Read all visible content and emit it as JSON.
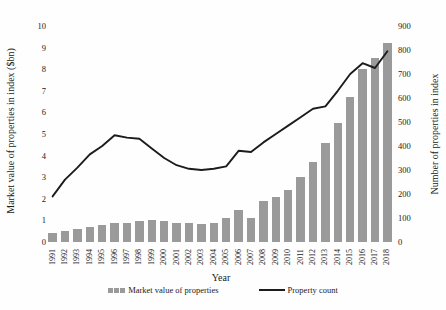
{
  "chart_data": {
    "type": "bar",
    "subtype": "combo-bar-line-dual-axis",
    "title": "",
    "xlabel": "Year",
    "categories": [
      "1991",
      "1992",
      "1993",
      "1994",
      "1995",
      "1996",
      "1997",
      "1998",
      "1999",
      "2000",
      "2001",
      "2002",
      "2003",
      "2004",
      "2005",
      "2006",
      "2007",
      "2008",
      "2009",
      "2010",
      "2011",
      "2012",
      "2013",
      "2014",
      "2015",
      "2016",
      "2017",
      "2018"
    ],
    "series": [
      {
        "name": "Market value of properties",
        "type": "bar",
        "axis": "left",
        "color": "#9a9a9a",
        "values": [
          0.4,
          0.5,
          0.6,
          0.7,
          0.8,
          0.9,
          0.9,
          0.95,
          1.0,
          0.95,
          0.9,
          0.9,
          0.85,
          0.9,
          1.1,
          1.5,
          1.1,
          1.9,
          2.1,
          2.4,
          3.0,
          3.7,
          4.6,
          5.5,
          6.7,
          8.0,
          8.5,
          9.2
        ]
      },
      {
        "name": "Property count",
        "type": "line",
        "axis": "right",
        "color": "#1c1c1c",
        "values": [
          190,
          260,
          310,
          365,
          400,
          445,
          435,
          430,
          390,
          350,
          320,
          305,
          300,
          305,
          315,
          380,
          375,
          415,
          450,
          485,
          520,
          555,
          565,
          630,
          700,
          745,
          725,
          795
        ]
      }
    ],
    "left_axis": {
      "label": "Market value of properties in index ($bn)",
      "min": 0,
      "max": 10,
      "step": 1,
      "ticks": [
        "0",
        "1",
        "2",
        "3",
        "4",
        "5",
        "6",
        "7",
        "8",
        "9",
        "10"
      ]
    },
    "right_axis": {
      "label": "Number of properties in index",
      "min": 0,
      "max": 900,
      "step": 100,
      "ticks": [
        "0",
        "100",
        "200",
        "300",
        "400",
        "500",
        "600",
        "700",
        "800",
        "900"
      ]
    },
    "legend": {
      "position": "bottom",
      "items": [
        "Market value of properties",
        "Property count"
      ]
    },
    "grid": "off",
    "colors": {
      "bar": "#9a9a9a",
      "line": "#1c1c1c",
      "text": "#1a1a1a",
      "background": "#fefefe"
    }
  }
}
